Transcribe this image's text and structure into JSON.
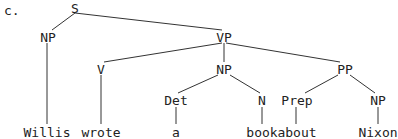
{
  "example_label": "c.",
  "tree": {
    "nodes": {
      "S": "S",
      "NP_subj": "NP",
      "VP": "VP",
      "V": "V",
      "NP_obj": "NP",
      "PP": "PP",
      "Det": "Det",
      "N": "N",
      "Prep": "Prep",
      "NP_pobj": "NP"
    },
    "leaves": {
      "willis": "Willis",
      "wrote": "wrote",
      "a": "a",
      "book": "book",
      "about": "about",
      "nixon": "Nixon"
    },
    "structure": "[S [NP Willis] [VP [V wrote] [NP [Det a] [N book]] [PP [Prep about] [NP Nixon]]]]"
  }
}
